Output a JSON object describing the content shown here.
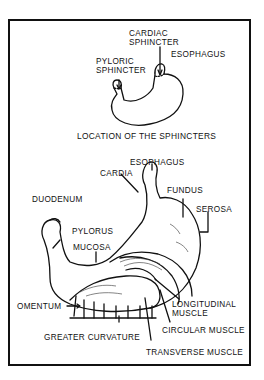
{
  "diagram": {
    "top": {
      "labels": {
        "cardiac_sphincter_1": "CARDIAC",
        "cardiac_sphincter_2": "SPHINCTER",
        "esophagus": "ESOPHAGUS",
        "pyloric_sphincter_1": "PYLORIC",
        "pyloric_sphincter_2": "SPHINCTER"
      },
      "caption": "LOCATION OF THE SPHINCTERS"
    },
    "bottom": {
      "labels": {
        "esophagus": "ESOPHAGUS",
        "cardia": "CARDIA",
        "fundus": "FUNDUS",
        "duodenum": "DUODENUM",
        "serosa": "SEROSA",
        "pylorus": "PYLORUS",
        "mucosa": "MUCOSA",
        "longitudinal_1": "LONGITUDINAL",
        "longitudinal_2": "MUSCLE",
        "omentum": "OMENTUM",
        "circular_muscle": "CIRCULAR MUSCLE",
        "greater_curvature": "GREATER CURVATURE",
        "transverse_muscle": "TRANSVERSE MUSCLE"
      }
    },
    "colors": {
      "ink": "#111111",
      "background": "#ffffff"
    }
  }
}
